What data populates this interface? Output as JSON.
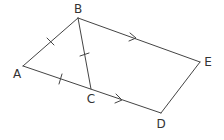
{
  "diagram": {
    "type": "geometry",
    "line_color": "#444444",
    "points": {
      "A": {
        "label": "A",
        "x": 23,
        "y": 66,
        "lx": 17,
        "ly": 74
      },
      "B": {
        "label": "B",
        "x": 78,
        "y": 18,
        "lx": 78,
        "ly": 9
      },
      "C": {
        "label": "C",
        "x": 91,
        "y": 89,
        "lx": 91,
        "ly": 99
      },
      "D": {
        "label": "D",
        "x": 161,
        "y": 113,
        "lx": 161,
        "ly": 124
      },
      "E": {
        "label": "E",
        "x": 200,
        "y": 62,
        "lx": 208,
        "ly": 62
      }
    },
    "segments": [
      {
        "from": "A",
        "to": "B",
        "marker": "tick"
      },
      {
        "from": "B",
        "to": "C",
        "marker": "tick"
      },
      {
        "from": "A",
        "to": "C",
        "marker": "tick"
      },
      {
        "from": "C",
        "to": "D",
        "marker": "arrow"
      },
      {
        "from": "B",
        "to": "E",
        "marker": "arrow"
      },
      {
        "from": "D",
        "to": "E",
        "marker": "none"
      }
    ],
    "annotations": {
      "equal_segments": [
        "AB",
        "BC",
        "AC"
      ],
      "parallel_segments": [
        "BE",
        "CD"
      ]
    }
  }
}
